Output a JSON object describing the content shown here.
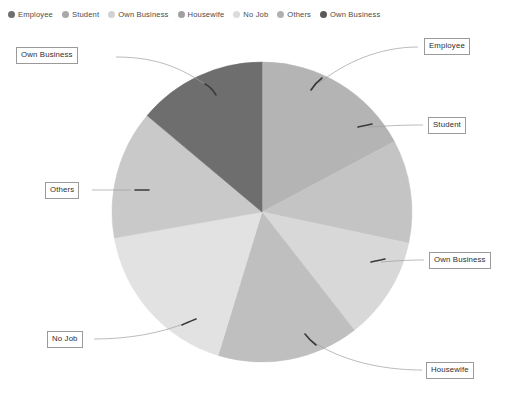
{
  "chart_data": {
    "type": "pie",
    "title": "",
    "legend_position": "top",
    "grid": false,
    "center": {
      "x": 262,
      "y": 212
    },
    "radius": 150,
    "categories": [
      "Employee",
      "Student",
      "Own Business",
      "Housewife",
      "No Job",
      "Others",
      "Own Business"
    ],
    "values": [
      17.2,
      11.1,
      11.1,
      15.3,
      17.5,
      13.9,
      13.9
    ],
    "colors": [
      "#b4b4b4",
      "#c4c4c4",
      "#d8d8d8",
      "#bfbfbf",
      "#e2e2e2",
      "#c9c9c9",
      "#6e6e6e"
    ],
    "slices": [
      {
        "label": "Employee",
        "value": 17.2,
        "start_angle": 0,
        "end_angle": 62,
        "color": "#b4b4b4"
      },
      {
        "label": "Student",
        "value": 11.1,
        "start_angle": 62,
        "end_angle": 102,
        "color": "#c4c4c4"
      },
      {
        "label": "Own Business",
        "value": 11.1,
        "start_angle": 102,
        "end_angle": 142,
        "color": "#d8d8d8"
      },
      {
        "label": "Housewife",
        "value": 15.3,
        "start_angle": 142,
        "end_angle": 197,
        "color": "#bfbfbf"
      },
      {
        "label": "No Job",
        "value": 17.5,
        "start_angle": 197,
        "end_angle": 260,
        "color": "#e2e2e2"
      },
      {
        "label": "Others",
        "value": 13.9,
        "start_angle": 260,
        "end_angle": 310,
        "color": "#c9c9c9"
      },
      {
        "label": "Own Business",
        "value": 13.9,
        "start_angle": 310,
        "end_angle": 360,
        "color": "#6e6e6e"
      }
    ],
    "xlabel": "",
    "ylabel": ""
  },
  "legend": {
    "items": [
      {
        "label": "Employee",
        "color": "#6f6f6f"
      },
      {
        "label": "Student",
        "color": "#a8a8a8"
      },
      {
        "label": "Own Business",
        "color": "#d2d2d2"
      },
      {
        "label": "Housewife",
        "color": "#a0a0a0"
      },
      {
        "label": "No Job",
        "color": "#dcdcdc"
      },
      {
        "label": "Others",
        "color": "#b0b0b0"
      },
      {
        "label": "Own Business",
        "color": "#5a5a5a"
      }
    ]
  },
  "callouts": [
    {
      "label": "Own Business",
      "left": 16,
      "top": 47
    },
    {
      "label": "Employee",
      "left": 424,
      "top": 38
    },
    {
      "label": "Student",
      "left": 428,
      "top": 117
    },
    {
      "label": "Own Business",
      "left": 429,
      "top": 252
    },
    {
      "label": "Housewife",
      "left": 426,
      "top": 362
    },
    {
      "label": "No Job",
      "left": 47,
      "top": 331
    },
    {
      "label": "Others",
      "left": 45,
      "top": 182
    }
  ],
  "leaders": [
    {
      "name": "leader-own-business-top",
      "d": "M 116 57 C 160 57, 185 70, 212 89"
    },
    {
      "name": "leader-employee",
      "d": "M 418 47 C 380 47, 345 62, 318 84"
    },
    {
      "name": "leader-student",
      "d": "M 423 125 C 400 125, 385 126, 368 127"
    },
    {
      "name": "leader-own-business-right",
      "d": "M 424 260 C 405 260, 395 261, 381 262"
    },
    {
      "name": "leader-housewife",
      "d": "M 422 370 C 380 370, 340 360, 312 341"
    },
    {
      "name": "leader-no-job",
      "d": "M 94 339 C 130 339, 160 333, 186 323"
    },
    {
      "name": "leader-others",
      "d": "M 92 190 C 110 190, 120 190, 131 190"
    }
  ],
  "tick_marks": [
    {
      "name": "tick-own-business-top",
      "d": "M 205 84 C 209 86, 213 90, 216 95"
    },
    {
      "name": "tick-employee",
      "d": "M 322 78 C 318 81, 314 85, 311 90"
    },
    {
      "name": "tick-student",
      "d": "M 372 124 C 368 125, 363 126, 358 127"
    },
    {
      "name": "tick-own-business-right",
      "d": "M 385 259 C 381 260, 376 261, 371 262"
    },
    {
      "name": "tick-housewife",
      "d": "M 316 345 C 312 342, 308 338, 305 334"
    },
    {
      "name": "tick-no-job",
      "d": "M 182 325 C 186 323, 191 321, 196 319"
    },
    {
      "name": "tick-others",
      "d": "M 135 190 C 139 190, 144 190, 149 190"
    }
  ]
}
